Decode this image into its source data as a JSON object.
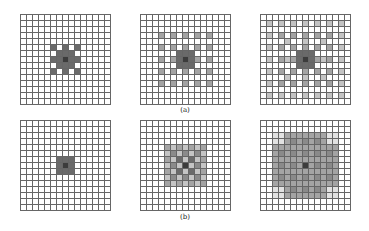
{
  "figure": {
    "grid_size": 15,
    "colors": {
      "0": "#ffffff",
      "1": "#e2e2e2",
      "2": "#c4c4c4",
      "3": "#a4a4a4",
      "4": "#8a8a8a",
      "5": "#6a6a6a",
      "6": "#3c3c3c"
    },
    "row_labels": [
      "(a)",
      "(b)"
    ],
    "panels": [
      {
        "id": "a1",
        "x": 20,
        "y": 14,
        "type": "dilated",
        "steps": [
          [
            2,
            5,
            6
          ]
        ],
        "center": 6
      },
      {
        "id": "a2",
        "x": 140,
        "y": 14,
        "type": "dilated",
        "steps": [
          [
            2,
            5,
            6
          ],
          [
            4,
            3,
            6
          ]
        ],
        "center": 6
      },
      {
        "id": "a3",
        "x": 260,
        "y": 14,
        "type": "dilated",
        "steps": [
          [
            2,
            5,
            6
          ],
          [
            4,
            3,
            6
          ],
          [
            6,
            1,
            6
          ]
        ],
        "center": 6
      },
      {
        "id": "b1",
        "x": 20,
        "y": 120,
        "type": "block",
        "radius": 1,
        "center": 6
      },
      {
        "id": "b2",
        "x": 140,
        "y": 120,
        "type": "checker",
        "radius": 3,
        "center": 6
      },
      {
        "id": "b3",
        "x": 260,
        "y": 120,
        "type": "cross",
        "radius": 5,
        "center": 6
      }
    ]
  }
}
